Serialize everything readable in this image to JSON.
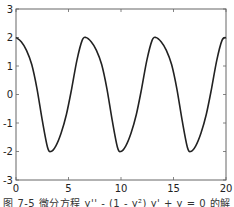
{
  "caption": "图 7-5  微分方程 y'' - (1 - y²) y' + y = 0 的解",
  "chart_data": {
    "type": "line",
    "title": "",
    "xlabel": "",
    "ylabel": "",
    "xlim": [
      0,
      20
    ],
    "ylim": [
      -3,
      3
    ],
    "xticks": [
      0,
      5,
      10,
      15,
      20
    ],
    "yticks": [
      -3,
      -2,
      -1,
      0,
      1,
      2,
      3
    ],
    "grid": false,
    "legend": null,
    "series": [
      {
        "name": "y(t)",
        "color": "#222222",
        "x": [
          0,
          0.5,
          1.0,
          1.5,
          2.0,
          2.5,
          3.0,
          3.33,
          3.8,
          4.3,
          4.8,
          5.3,
          5.8,
          6.3,
          6.66,
          7.16,
          7.66,
          8.16,
          8.66,
          9.16,
          9.66,
          9.99,
          10.46,
          10.96,
          11.46,
          11.96,
          12.46,
          12.96,
          13.32,
          13.82,
          14.32,
          14.82,
          15.32,
          15.82,
          16.32,
          16.65,
          17.12,
          17.62,
          18.12,
          18.62,
          19.12,
          19.62,
          20.0
        ],
        "y": [
          2.0,
          1.85,
          1.55,
          1.05,
          0.2,
          -0.9,
          -1.85,
          -2.0,
          -1.8,
          -1.35,
          -0.7,
          0.2,
          1.2,
          1.9,
          2.0,
          1.85,
          1.55,
          1.05,
          0.2,
          -0.9,
          -1.85,
          -2.0,
          -1.8,
          -1.35,
          -0.7,
          0.2,
          1.2,
          1.9,
          2.0,
          1.85,
          1.55,
          1.05,
          0.2,
          -0.9,
          -1.85,
          -2.0,
          -1.8,
          -1.35,
          -0.7,
          0.2,
          1.2,
          1.9,
          2.0
        ]
      }
    ]
  }
}
